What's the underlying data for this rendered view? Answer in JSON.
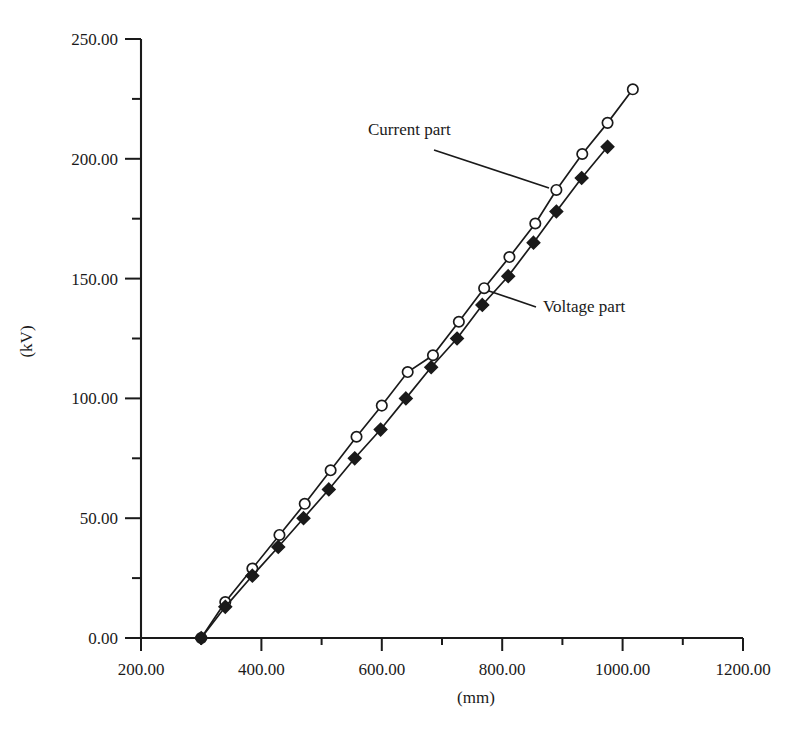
{
  "chart_data": {
    "type": "line",
    "title": "",
    "xlabel": "(mm)",
    "ylabel": "(kV)",
    "xlim": [
      200,
      1200
    ],
    "ylim": [
      0,
      250
    ],
    "grid": false,
    "legend_position": "inline-annotations",
    "x_ticks": [
      "200.00",
      "400.00",
      "600.00",
      "800.00",
      "1000.00",
      "1200.00"
    ],
    "x_tick_values": [
      200,
      400,
      600,
      800,
      1000,
      1200
    ],
    "x_minor_tick_values": [
      300,
      500,
      700,
      900,
      1100
    ],
    "y_ticks": [
      "0.00",
      "50.00",
      "100.00",
      "150.00",
      "200.00",
      "250.00"
    ],
    "y_tick_values": [
      0,
      50,
      100,
      150,
      200,
      250
    ],
    "y_minor_tick_values": [
      25,
      75,
      125,
      175,
      225
    ],
    "annotations": [
      {
        "text": "Current part",
        "text_x": 368,
        "text_y": 135,
        "leader_from_x": 434,
        "leader_from_y": 150,
        "leader_to_x": 549,
        "leader_to_y": 188
      },
      {
        "text": "Voltage part",
        "text_x": 543,
        "text_y": 312,
        "leader_from_x": 536,
        "leader_from_y": 307,
        "leader_to_x": 489,
        "leader_to_y": 291
      }
    ],
    "series": [
      {
        "name": "Current part",
        "marker": "open-circle",
        "x": [
          300,
          340,
          385,
          430,
          472,
          515,
          558,
          600,
          643,
          685,
          728,
          770,
          812,
          855,
          890,
          933,
          975,
          1017
        ],
        "y": [
          0,
          15,
          29,
          43,
          56,
          70,
          84,
          97,
          111,
          118,
          132,
          146,
          159,
          173,
          187,
          202,
          215,
          229
        ]
      },
      {
        "name": "Voltage part",
        "marker": "filled-diamond",
        "x": [
          300,
          340,
          385,
          428,
          470,
          512,
          555,
          598,
          640,
          682,
          725,
          767,
          810,
          852,
          890,
          932,
          975
        ],
        "y": [
          0,
          13,
          26,
          38,
          50,
          62,
          75,
          87,
          100,
          113,
          125,
          139,
          151,
          165,
          178,
          192,
          205
        ]
      }
    ]
  },
  "axes_pixels": {
    "x_left_px": 141,
    "x_right_px": 743,
    "y_bottom_px": 638,
    "y_top_px": 39
  }
}
